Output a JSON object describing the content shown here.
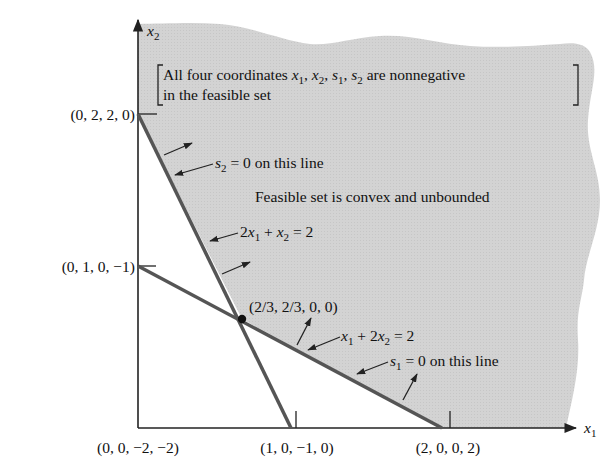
{
  "colors": {
    "feasible_fill": "#d3d3d3",
    "constraint_line": "#555555",
    "axis": "#222222",
    "text": "#111111",
    "background": "#ffffff"
  },
  "axes": {
    "x_label": "x",
    "x_label_sub": "1",
    "y_label": "x",
    "y_label_sub": "2"
  },
  "note": {
    "line1_a": "All four coordinates ",
    "line1_vars": [
      {
        "v": "x",
        "s": "1"
      },
      {
        "v": "x",
        "s": "2"
      },
      {
        "v": "s",
        "s": "1"
      },
      {
        "v": "s",
        "s": "2"
      }
    ],
    "line1_b": " are nonnegative",
    "line2": "in the feasible set"
  },
  "statement": "Feasible set is convex and unbounded",
  "constraints": [
    {
      "name": "2x1 + x2 = 2",
      "eq_parts": [
        "2",
        "x",
        "1",
        " + ",
        "x",
        "2",
        " = 2"
      ],
      "slack_note_var": "s",
      "slack_note_sub": "2",
      "slack_note_rest": " = 0 on this line"
    },
    {
      "name": "x1 + 2x2 = 2",
      "eq_parts": [
        "",
        "x",
        "1",
        " + 2",
        "x",
        "2",
        " = 2"
      ],
      "slack_note_var": "s",
      "slack_note_sub": "1",
      "slack_note_rest": " = 0 on this line"
    }
  ],
  "points": {
    "origin": "(0, 0, −2, −2)",
    "y_at_2": "(0, 2, 2, 0)",
    "y_at_1": "(0, 1, 0, −1)",
    "x_at_1": "(1, 0, −1, 0)",
    "x_at_2": "(2, 0, 0, 2)",
    "corner": "(2/3, 2/3, 0, 0)"
  }
}
